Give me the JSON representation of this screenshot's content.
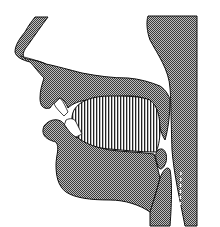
{
  "diagram": {
    "type": "sagittal-section-vocal-tract",
    "width": 220,
    "height": 227,
    "colors": {
      "background": "#ffffff",
      "outline": "#111111",
      "tissue_dark": "#3a3a3a",
      "tissue_light": "#bdbdbd",
      "tongue_stripe": "#222222"
    },
    "parts": [
      {
        "name": "nose",
        "fill": "checker"
      },
      {
        "name": "upper-lip",
        "fill": "checker"
      },
      {
        "name": "hard-palate",
        "fill": "checker"
      },
      {
        "name": "velum",
        "fill": "checker"
      },
      {
        "name": "pharynx-wall",
        "fill": "checker"
      },
      {
        "name": "upper-teeth",
        "fill": "white"
      },
      {
        "name": "lower-teeth",
        "fill": "white"
      },
      {
        "name": "tongue",
        "fill": "vertical-stripes"
      },
      {
        "name": "lower-lip-jaw",
        "fill": "checker"
      },
      {
        "name": "epiglottis",
        "fill": "checker"
      },
      {
        "name": "vocal-folds-marker",
        "fill": "dashed-white"
      }
    ]
  }
}
